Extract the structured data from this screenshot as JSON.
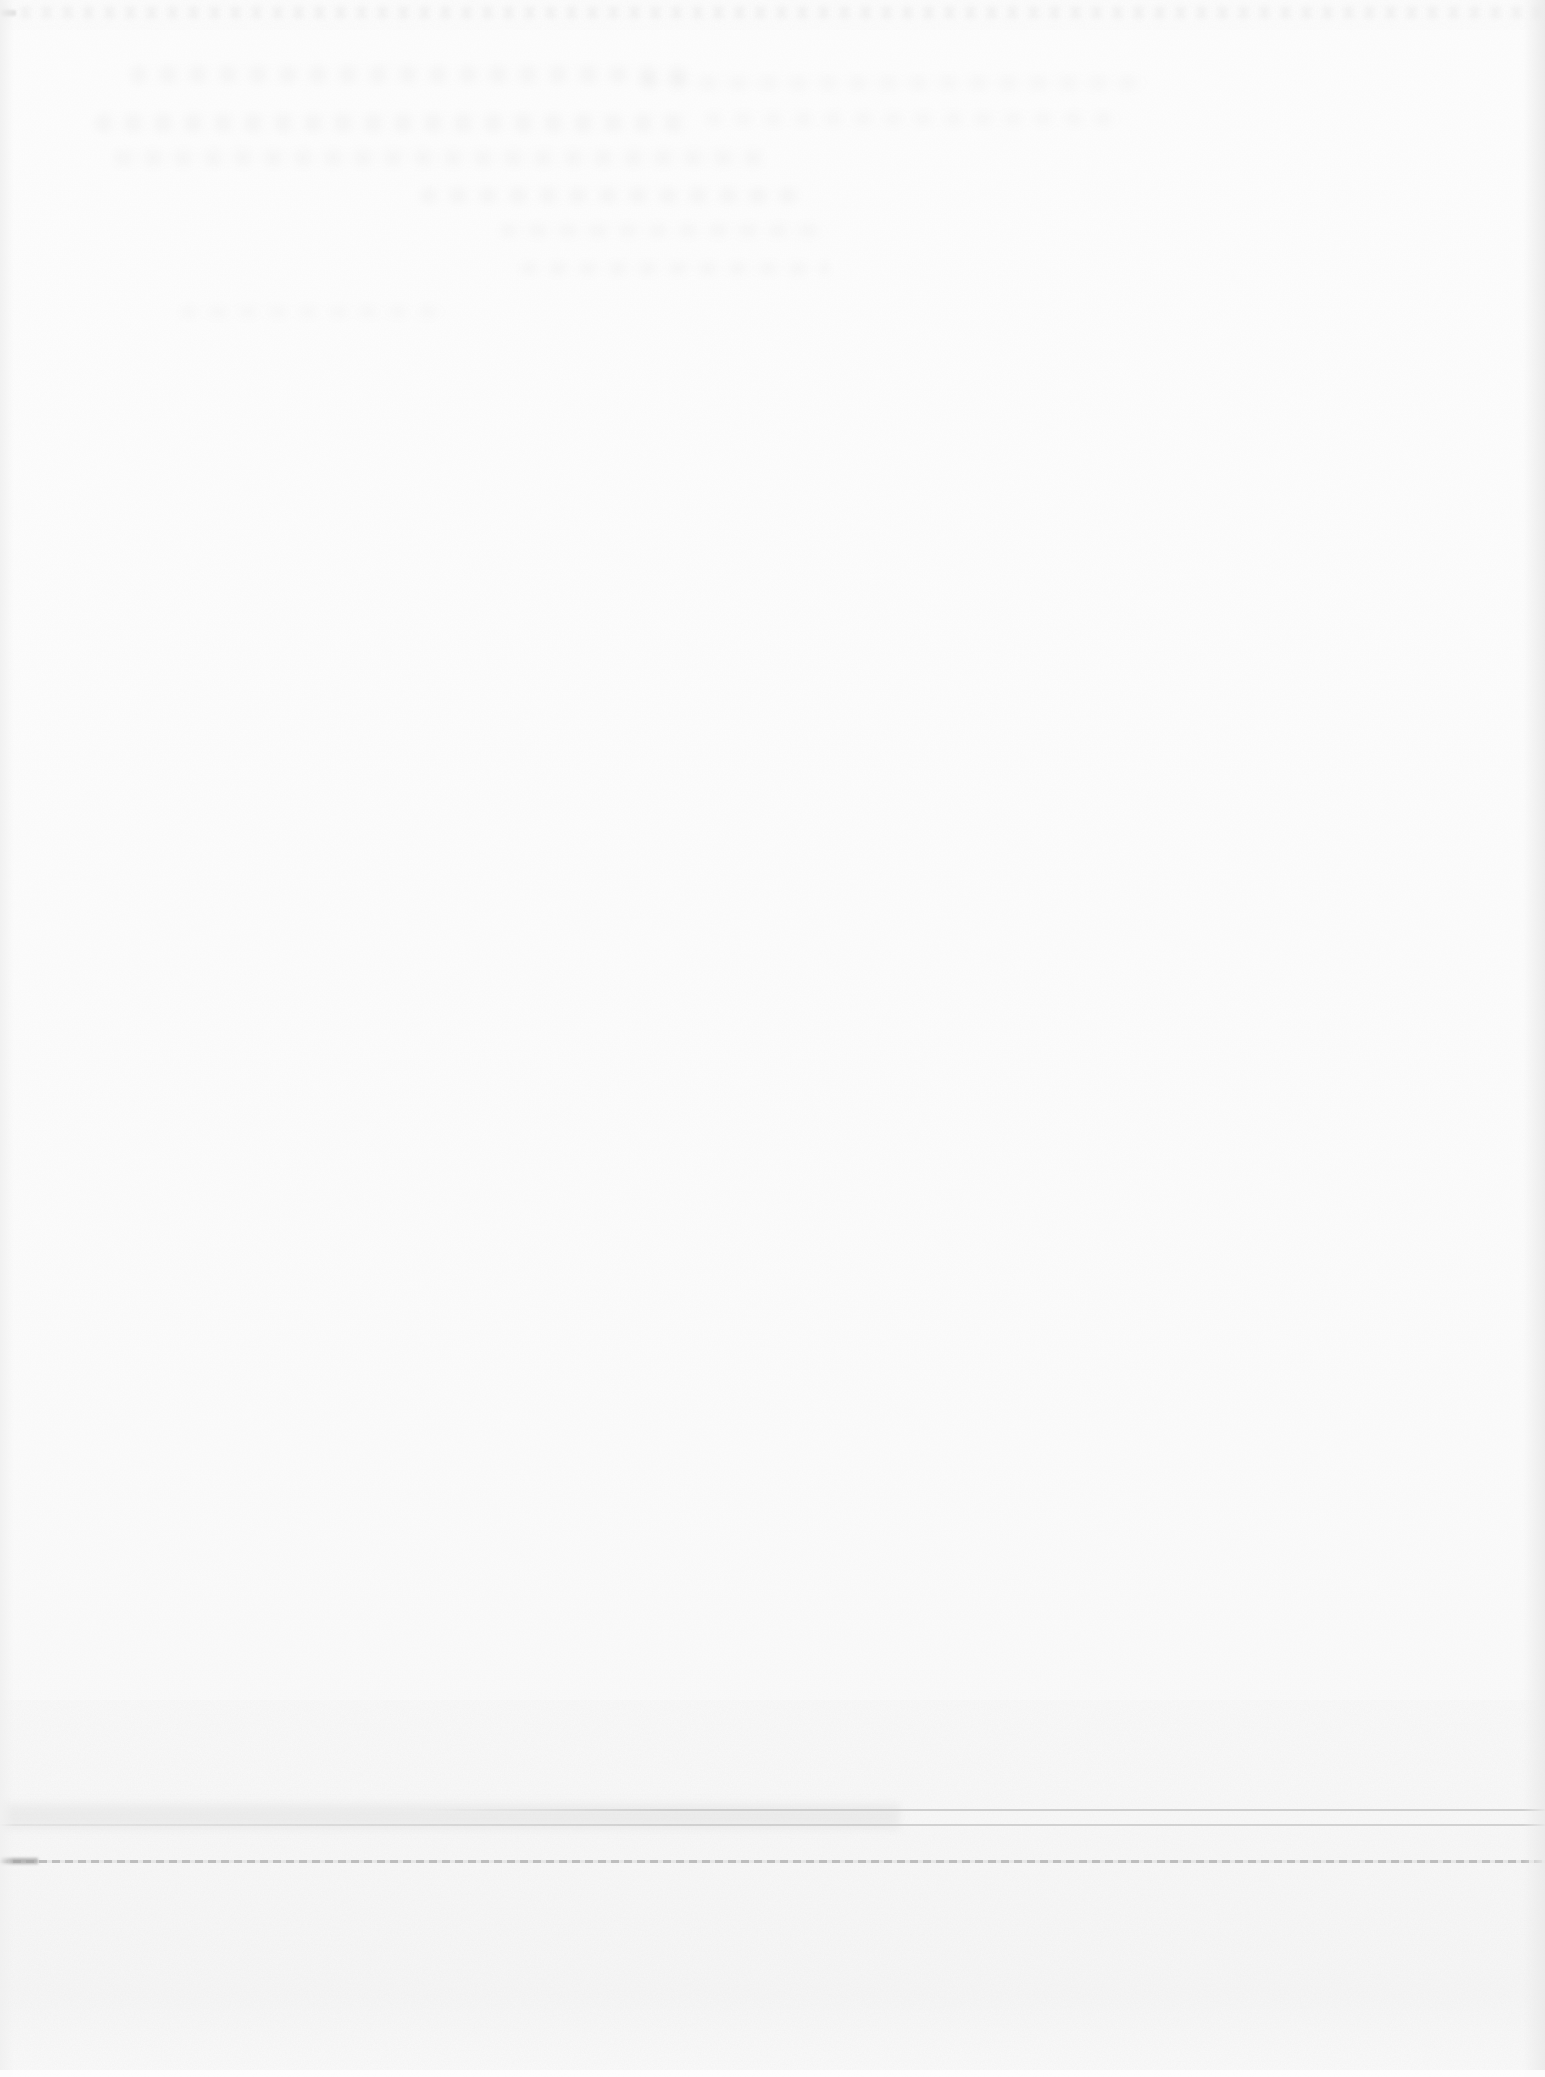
{
  "document": {
    "kind": "blank-scanned-page",
    "description": "Blank scanned book page: no printed text; only paper grain, faint illegible bleed-through smudges in the upper area, scan edge shading, and three faint horizontal lines near the bottom.",
    "visible_text": ""
  },
  "colors": {
    "paper_top": "#fdfdfd",
    "paper_bottom": "#f7f7f7",
    "grain": "#8c8c8c",
    "ghost_smudge": "#9a9a9a",
    "top_band": "#e9e9e9",
    "rule_faint": "#c9c9c9",
    "rule_dark": "#b9b9b9",
    "rule_end_blob": "#a6a6a6",
    "top_corner_dash": "#cfcfcf",
    "edge_left": "#f0f0f0",
    "edge_right": "#eaeaea"
  },
  "artifacts": {
    "ghost_text_area": {
      "x_px": 90,
      "y_px": 55,
      "width_px": 1120,
      "height_px": 280,
      "legible": false
    },
    "rule_lines": [
      {
        "id": "faint-rule-upper",
        "y_px": 1810,
        "x_start_px": 430,
        "x_end_px": 1545
      },
      {
        "id": "faint-rule-lower",
        "y_px": 1825,
        "x_start_px": 0,
        "x_end_px": 1545
      },
      {
        "id": "dark-rule",
        "y_px": 1861,
        "x_start_px": 0,
        "x_end_px": 1545
      }
    ]
  }
}
